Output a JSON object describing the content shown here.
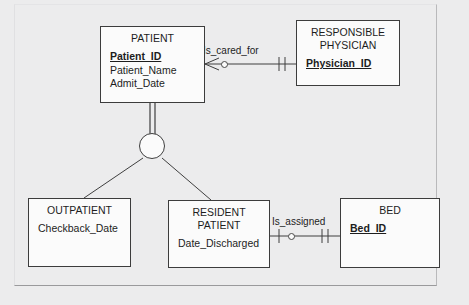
{
  "diagram": {
    "type": "entity-relationship-diagram",
    "notation": "crows-foot",
    "background_color": "#ececed",
    "entity_fill_color": "#fbfbfb",
    "line_color": "#3f3f3f"
  },
  "entities": [
    {
      "id": "patient",
      "title": "PATIENT",
      "role": "supertype",
      "attributes": [
        {
          "name": "Patient_ID",
          "key": true
        },
        {
          "name": "Patient_Name",
          "key": false
        },
        {
          "name": "Admit_Date",
          "key": false
        }
      ]
    },
    {
      "id": "responsible_physician",
      "title": "RESPONSIBLE\nPHYSICIAN",
      "role": "entity",
      "attributes": [
        {
          "name": "Physician_ID",
          "key": true
        }
      ]
    },
    {
      "id": "outpatient",
      "title": "OUTPATIENT",
      "role": "subtype",
      "attributes": [
        {
          "name": "Checkback_Date",
          "key": false
        }
      ]
    },
    {
      "id": "resident_patient",
      "title": "RESIDENT\nPATIENT",
      "role": "subtype",
      "attributes": [
        {
          "name": "Date_Discharged",
          "key": false
        }
      ]
    },
    {
      "id": "bed",
      "title": "BED",
      "role": "entity",
      "attributes": [
        {
          "name": "Bed_ID",
          "key": true
        }
      ]
    }
  ],
  "relationships": [
    {
      "id": "is_cared_for",
      "label": "Is_cared_for",
      "from": "PATIENT",
      "to": "RESPONSIBLE PHYSICIAN",
      "from_cardinality": "zero-or-many",
      "to_cardinality": "exactly-one"
    },
    {
      "id": "is_assigned",
      "label": "Is_assigned",
      "from": "RESIDENT PATIENT",
      "to": "BED",
      "from_cardinality": "zero-or-one",
      "to_cardinality": "exactly-one"
    }
  ],
  "generalization": {
    "supertype": "PATIENT",
    "subtypes": [
      "OUTPATIENT",
      "RESIDENT PATIENT"
    ],
    "connector": "subtype-circle",
    "completeness": "total-specialization-double-line"
  }
}
